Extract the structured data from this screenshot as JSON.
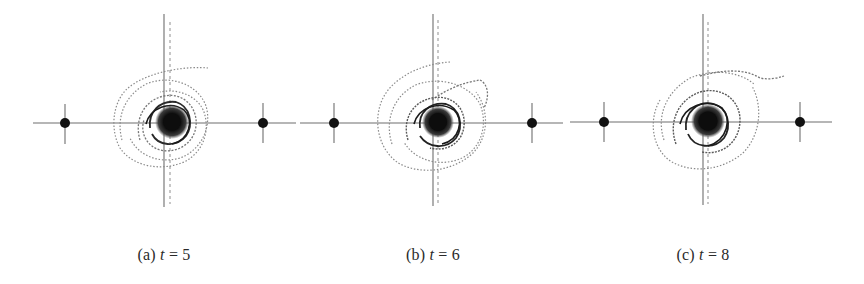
{
  "figure": {
    "panels": [
      {
        "id": "a",
        "label": "(a)",
        "variable": "t",
        "equals": "=",
        "value": "5",
        "caption_center_x": 164,
        "center": {
          "x": 172,
          "y": 122
        },
        "axis_vertical_x": 164,
        "axis_dashed_x": 170,
        "axis_h_start": 33,
        "axis_h_end": 296,
        "dots": [
          {
            "x": 65,
            "y": 123
          },
          {
            "x": 263,
            "y": 123
          }
        ]
      },
      {
        "id": "b",
        "label": "(b)",
        "variable": "t",
        "equals": "=",
        "value": "6",
        "caption_center_x": 433,
        "center": {
          "x": 438,
          "y": 122
        },
        "axis_vertical_x": 433,
        "axis_dashed_x": 438,
        "axis_h_start": 300,
        "axis_h_end": 563,
        "dots": [
          {
            "x": 334,
            "y": 123
          },
          {
            "x": 532,
            "y": 123
          }
        ]
      },
      {
        "id": "c",
        "label": "(c)",
        "variable": "t",
        "equals": "=",
        "value": "8",
        "caption_center_x": 703,
        "center": {
          "x": 708,
          "y": 121
        },
        "axis_vertical_x": 703,
        "axis_dashed_x": 708,
        "axis_h_start": 570,
        "axis_h_end": 832,
        "dots": [
          {
            "x": 604,
            "y": 122
          },
          {
            "x": 800,
            "y": 122
          }
        ]
      }
    ],
    "colors": {
      "axis": "#6e6e6e",
      "dashed": "#9a9a9a",
      "dot": "#111111",
      "spiral_light": "#8a8a8a",
      "spiral_dark": "#1a1a1a"
    }
  }
}
